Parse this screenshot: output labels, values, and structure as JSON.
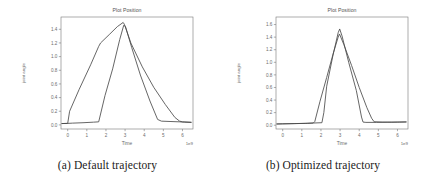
{
  "figure": {
    "subfigures": [
      {
        "caption": "(a) Default trajectory",
        "chart_key": "left"
      },
      {
        "caption": "(b) Optimized trajectory",
        "chart_key": "right"
      }
    ]
  },
  "chart_data": [
    {
      "id": "left",
      "type": "line",
      "title": "Plot Position",
      "xlabel": "Time",
      "ylabel": "joint angle",
      "x_exponent_label": "1e9",
      "xlim": [
        -0.35,
        6.55
      ],
      "ylim": [
        -0.06,
        1.58
      ],
      "xticks": [
        0,
        1,
        2,
        3,
        4,
        5,
        6
      ],
      "xticklabels": [
        "0",
        "1",
        "2",
        "3",
        "4",
        "5",
        "6"
      ],
      "yticks": [
        0.0,
        0.2,
        0.4,
        0.6,
        0.8,
        1.0,
        1.2,
        1.4
      ],
      "yticklabels": [
        "0.0",
        "0.2",
        "0.4",
        "0.6",
        "0.8",
        "1.0",
        "1.2",
        "1.4"
      ],
      "grid": false,
      "legend": "none",
      "line_color": "#4a4a4a",
      "series": [
        {
          "name": "trajectory-a1",
          "x": [
            -0.3,
            0.0,
            0.25,
            0.8,
            1.35,
            1.62,
            1.95,
            2.35,
            2.72,
            2.93,
            3.02,
            3.35,
            3.8,
            4.3,
            4.7,
            4.9,
            5.35,
            5.85,
            6.1,
            6.45
          ],
          "y": [
            0.02,
            0.022,
            0.026,
            0.032,
            0.04,
            0.045,
            0.43,
            0.82,
            1.25,
            1.46,
            1.44,
            1.13,
            0.73,
            0.35,
            0.08,
            0.055,
            0.05,
            0.045,
            0.04,
            0.035
          ]
        },
        {
          "name": "trajectory-a2",
          "x": [
            -0.3,
            0.0,
            0.1,
            0.6,
            1.2,
            1.62,
            1.72,
            2.2,
            2.6,
            2.9,
            2.97,
            3.3,
            3.9,
            4.5,
            5.1,
            5.6,
            5.85,
            6.0,
            6.45
          ],
          "y": [
            0.02,
            0.022,
            0.2,
            0.52,
            0.88,
            1.15,
            1.2,
            1.33,
            1.44,
            1.5,
            1.47,
            1.2,
            0.85,
            0.55,
            0.3,
            0.11,
            0.055,
            0.045,
            0.04
          ]
        }
      ]
    },
    {
      "id": "right",
      "type": "line",
      "title": "Plot Position",
      "xlabel": "Time",
      "ylabel": "joint angle",
      "x_exponent_label": "1e9",
      "xlim": [
        -0.35,
        6.55
      ],
      "ylim": [
        -0.06,
        1.72
      ],
      "xticks": [
        0,
        1,
        2,
        3,
        4,
        5,
        6
      ],
      "xticklabels": [
        "0",
        "1",
        "2",
        "3",
        "4",
        "5",
        "6"
      ],
      "yticks": [
        0.0,
        0.2,
        0.4,
        0.6,
        0.8,
        1.0,
        1.2,
        1.4,
        1.6
      ],
      "yticklabels": [
        "0.0",
        "0.2",
        "0.4",
        "0.6",
        "0.8",
        "1.0",
        "1.2",
        "1.4",
        "1.6"
      ],
      "grid": false,
      "legend": "none",
      "line_color": "#4a4a4a",
      "series": [
        {
          "name": "trajectory-b1",
          "x": [
            -0.3,
            0.0,
            0.6,
            1.2,
            1.6,
            2.05,
            2.15,
            2.3,
            2.62,
            2.9,
            2.98,
            3.1,
            3.45,
            3.85,
            4.12,
            4.2,
            4.35,
            4.9,
            5.5,
            6.0,
            6.45
          ],
          "y": [
            0.02,
            0.022,
            0.026,
            0.03,
            0.035,
            0.04,
            0.2,
            0.62,
            1.1,
            1.47,
            1.53,
            1.42,
            1.0,
            0.55,
            0.13,
            0.05,
            0.045,
            0.045,
            0.048,
            0.05,
            0.052
          ]
        },
        {
          "name": "trajectory-b2",
          "x": [
            -0.3,
            0.0,
            0.7,
            1.3,
            1.6,
            1.68,
            1.95,
            2.3,
            2.65,
            2.9,
            2.97,
            3.2,
            3.6,
            4.0,
            4.4,
            4.65,
            4.78,
            5.2,
            5.7,
            6.1,
            6.45
          ],
          "y": [
            0.02,
            0.022,
            0.026,
            0.03,
            0.035,
            0.06,
            0.38,
            0.76,
            1.15,
            1.4,
            1.45,
            1.28,
            0.95,
            0.6,
            0.28,
            0.11,
            0.055,
            0.05,
            0.048,
            0.05,
            0.052
          ]
        }
      ]
    }
  ]
}
